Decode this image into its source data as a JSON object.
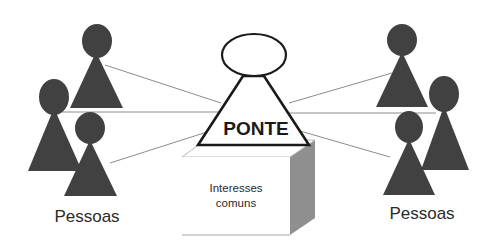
{
  "diagram": {
    "type": "concept-diagram",
    "center": {
      "label": "PONTE",
      "shape": "person-icon-outline-triangle-with-ellipse-head"
    },
    "pedestal": {
      "line1": "Interesses",
      "line2": "comuns",
      "shape": "3d-box"
    },
    "left_group": {
      "label": "Pessoas",
      "count": 3
    },
    "right_group": {
      "label": "Pessoas",
      "count": 3
    },
    "connections": [
      {
        "from": "left_group.person_1",
        "to": "center"
      },
      {
        "from": "left_group.person_2",
        "to": "center"
      },
      {
        "from": "left_group.person_3",
        "to": "center"
      },
      {
        "from": "right_group.person_1",
        "to": "center"
      },
      {
        "from": "right_group.person_2",
        "to": "center"
      },
      {
        "from": "right_group.person_3",
        "to": "center"
      }
    ],
    "colors": {
      "person_fill": "#414141",
      "connector": "#8c8c8c",
      "outline": "#1a1a1a",
      "box_side": "#8f8f8f",
      "background": "#ffffff"
    }
  }
}
